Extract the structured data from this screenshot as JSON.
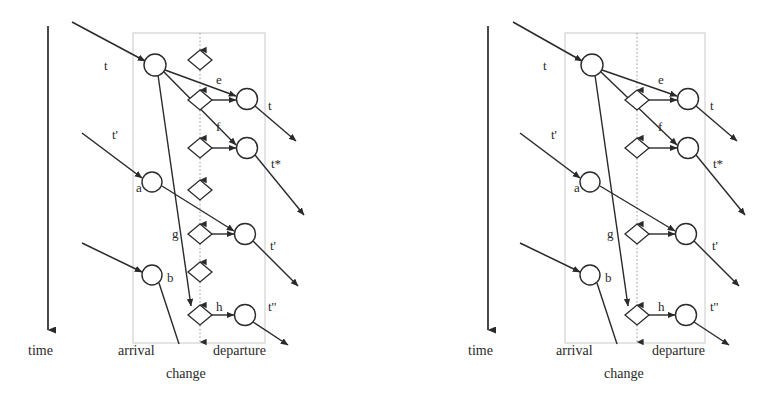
{
  "figure": {
    "type": "diagram",
    "stroke_color": "#2a2a2a",
    "box_color": "#bdbdbd",
    "background": "#ffffff"
  },
  "panels": [
    {
      "id": "left",
      "axis": {
        "label": "time",
        "direction": "down"
      },
      "column_labels": {
        "arrival": "arrival",
        "departure": "departure",
        "change": "change"
      },
      "arrival_nodes": [
        {
          "id": "t",
          "label": "t",
          "cx": 155,
          "cy": 65
        },
        {
          "id": "a",
          "label": "a",
          "cx": 152,
          "cy": 182
        },
        {
          "id": "b",
          "label": "b",
          "cx": 152,
          "cy": 275
        }
      ],
      "departure_nodes": [
        {
          "id": "dt",
          "label": "t",
          "cx": 247,
          "cy": 99
        },
        {
          "id": "dts",
          "label": "t*",
          "cx": 247,
          "cy": 148
        },
        {
          "id": "dtp",
          "label": "t'",
          "cx": 245,
          "cy": 234
        },
        {
          "id": "dtpp",
          "label": "t''",
          "cx": 245,
          "cy": 315
        }
      ],
      "change_activities": [
        {
          "id": "c1",
          "label": "",
          "cx": 200,
          "cy": 60
        },
        {
          "id": "c2",
          "label": "e",
          "cx": 200,
          "cy": 100
        },
        {
          "id": "c3",
          "label": "f",
          "cx": 200,
          "cy": 148
        },
        {
          "id": "c4",
          "label": "",
          "cx": 200,
          "cy": 190
        },
        {
          "id": "c5",
          "label": "g",
          "cx": 200,
          "cy": 234
        },
        {
          "id": "c6",
          "label": "",
          "cx": 200,
          "cy": 272
        },
        {
          "id": "c7",
          "label": "h",
          "cx": 200,
          "cy": 315
        }
      ],
      "edge_labels": [
        "e",
        "f",
        "g",
        "h"
      ]
    },
    {
      "id": "right",
      "axis": {
        "label": "time",
        "direction": "down"
      },
      "column_labels": {
        "arrival": "arrival",
        "departure": "departure",
        "change": "change"
      },
      "arrival_nodes": [
        {
          "id": "t",
          "label": "t",
          "cx": 592,
          "cy": 65
        },
        {
          "id": "a",
          "label": "a",
          "cx": 590,
          "cy": 182
        },
        {
          "id": "b",
          "label": "b",
          "cx": 590,
          "cy": 275
        }
      ],
      "departure_nodes": [
        {
          "id": "dt",
          "label": "t",
          "cx": 688,
          "cy": 99
        },
        {
          "id": "dts",
          "label": "t*",
          "cx": 688,
          "cy": 148
        },
        {
          "id": "dtp",
          "label": "t'",
          "cx": 686,
          "cy": 234
        },
        {
          "id": "dtpp",
          "label": "t''",
          "cx": 686,
          "cy": 315
        }
      ],
      "change_activities": [
        {
          "id": "c2",
          "label": "e",
          "cx": 637,
          "cy": 100
        },
        {
          "id": "c3",
          "label": "f",
          "cx": 637,
          "cy": 148
        },
        {
          "id": "c5",
          "label": "g",
          "cx": 637,
          "cy": 234
        },
        {
          "id": "c7",
          "label": "h",
          "cx": 637,
          "cy": 315
        }
      ],
      "edge_labels": [
        "e",
        "f",
        "g",
        "h"
      ]
    }
  ],
  "left_panel": {
    "time_label": "time",
    "arrival_label": "arrival",
    "departure_label": "departure",
    "change_label": "change",
    "n_t": "t",
    "n_a": "a",
    "n_b": "b",
    "n_tp_in": "t'",
    "d_t": "t",
    "d_tstar": "t*",
    "d_tp": "t'",
    "d_tpp": "t''",
    "e_e": "e",
    "e_f": "f",
    "e_g": "g",
    "e_h": "h"
  },
  "right_panel": {
    "time_label": "time",
    "arrival_label": "arrival",
    "departure_label": "departure",
    "change_label": "change",
    "n_t": "t",
    "n_a": "a",
    "n_b": "b",
    "n_tp_in": "t'",
    "d_t": "t",
    "d_tstar": "t*",
    "d_tp": "t'",
    "d_tpp": "t''",
    "e_e": "e",
    "e_f": "f",
    "e_g": "g",
    "e_h": "h"
  }
}
